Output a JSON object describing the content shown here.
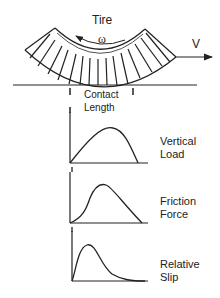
{
  "diagram": {
    "tire_label": "Tire",
    "omega_label": "ω",
    "velocity_label": "V",
    "contact_label_line1": "Contact",
    "contact_label_line2": "Length"
  },
  "charts": [
    {
      "label_line1": "Vertical",
      "label_line2": "Load",
      "shape": "skewed-right-peak"
    },
    {
      "label_line1": "Friction",
      "label_line2": "Force",
      "shape": "s-rise-peak-linear-fall"
    },
    {
      "label_line1": "Relative",
      "label_line2": "Slip",
      "shape": "early-peak-long-tail"
    }
  ],
  "colors": {
    "stroke": "#222222",
    "background": "#ffffff"
  }
}
